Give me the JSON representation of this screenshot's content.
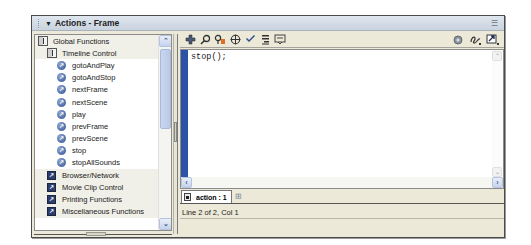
{
  "panel": {
    "title": "Actions - Frame",
    "collapse_glyph": "▼",
    "menu_icon": "panel-options-icon"
  },
  "toolbox": {
    "items": [
      {
        "label": "Global Functions",
        "level": 0,
        "type": "book"
      },
      {
        "label": "Timeline Control",
        "level": 1,
        "type": "book"
      },
      {
        "label": "gotoAndPlay",
        "level": 2,
        "type": "function"
      },
      {
        "label": "gotoAndStop",
        "level": 2,
        "type": "function"
      },
      {
        "label": "nextFrame",
        "level": 2,
        "type": "function"
      },
      {
        "label": "nextScene",
        "level": 2,
        "type": "function"
      },
      {
        "label": "play",
        "level": 2,
        "type": "function"
      },
      {
        "label": "prevFrame",
        "level": 2,
        "type": "function"
      },
      {
        "label": "prevScene",
        "level": 2,
        "type": "function"
      },
      {
        "label": "stop",
        "level": 2,
        "type": "function"
      },
      {
        "label": "stopAllSounds",
        "level": 2,
        "type": "function"
      },
      {
        "label": "Browser/Network",
        "level": 1,
        "type": "category"
      },
      {
        "label": "Movie Clip Control",
        "level": 1,
        "type": "category"
      },
      {
        "label": "Printing Functions",
        "level": 1,
        "type": "category"
      },
      {
        "label": "Miscellaneous Functions",
        "level": 1,
        "type": "category"
      }
    ],
    "scroll_up": "⌃",
    "scroll_down": "⌄"
  },
  "toolbar": {
    "left_icons": [
      "add-statement-icon",
      "find-icon",
      "replace-icon",
      "insert-target-path-icon",
      "check-syntax-icon",
      "auto-format-icon",
      "show-code-hint-icon"
    ],
    "right_icons": [
      "reference-icon",
      "debug-options-icon",
      "view-options-icon"
    ]
  },
  "editor": {
    "code": "stop();"
  },
  "tabs": [
    {
      "label": "action : 1",
      "active": true
    }
  ],
  "status": {
    "text": "Line 2 of 2, Col 1"
  }
}
